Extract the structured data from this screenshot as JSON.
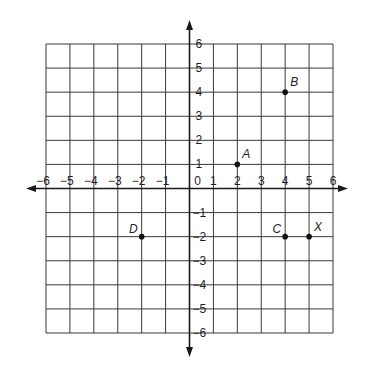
{
  "figure": {
    "type": "coordinate-plane",
    "x_range": [
      -6,
      6
    ],
    "y_range": [
      -6,
      6
    ],
    "x_tick_labels": [
      "-6",
      "-5",
      "-4",
      "-3",
      "-2",
      "-1",
      "0",
      "1",
      "2",
      "3",
      "4",
      "5",
      "6"
    ],
    "y_tick_labels_positive": [
      "1",
      "2",
      "3",
      "4",
      "5",
      "6"
    ],
    "y_tick_labels_negative": [
      "-1",
      "-2",
      "-3",
      "-4",
      "-5",
      "-6"
    ],
    "origin_label": "0",
    "grid": true,
    "points": [
      {
        "label": "A",
        "x": 2,
        "y": 1
      },
      {
        "label": "B",
        "x": 4,
        "y": 4
      },
      {
        "label": "C",
        "x": 4,
        "y": -2
      },
      {
        "label": "X",
        "x": 5,
        "y": -2
      },
      {
        "label": "D",
        "x": -2,
        "y": -2
      }
    ]
  },
  "colors": {
    "grid": "#3a3a3a",
    "axis": "#1a1a1a",
    "point": "#111111",
    "background": "#ffffff"
  }
}
